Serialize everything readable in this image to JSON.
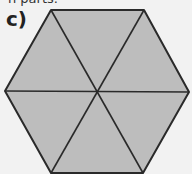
{
  "header": {
    "cut_off_text": "n parts."
  },
  "figure": {
    "label": "c)",
    "shape": "regular hexagon divided into 6 equal triangles",
    "fill_color": "#bdbdbd",
    "stroke_color": "#2a2a2a",
    "background_color": "#f2f2f2",
    "parts": 6
  }
}
